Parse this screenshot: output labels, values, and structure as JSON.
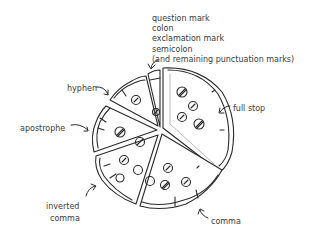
{
  "diagram": {
    "labels": {
      "top_list": [
        "question mark",
        "colon",
        "exclamation mark",
        "semicolon",
        "(and remaining punctuation marks)"
      ],
      "hyphen": "hyphen",
      "apostrophe": "apostrophe",
      "full_stop": "full stop",
      "inverted_comma": [
        "inverted",
        "comma"
      ],
      "comma": "comma"
    },
    "colors": {
      "ink": "#2a2a2a",
      "text": "#3a3a3a",
      "background": "#ffffff"
    }
  }
}
